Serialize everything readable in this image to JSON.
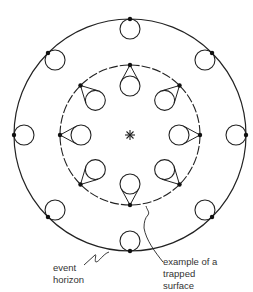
{
  "diagram": {
    "title": "",
    "center_marker": "star",
    "outer_circle": {
      "label": "event horizon",
      "style": "solid",
      "count_small_circles": 8
    },
    "inner_circle": {
      "label": "trapped surface",
      "style": "dashed",
      "count_small_circles": 8
    },
    "labels": {
      "event_horizon": [
        "event",
        "horizon"
      ],
      "trapped_surface": [
        "example of a",
        "trapped",
        "surface"
      ]
    },
    "colors": {
      "line": "#222222",
      "background": "#ffffff"
    }
  }
}
